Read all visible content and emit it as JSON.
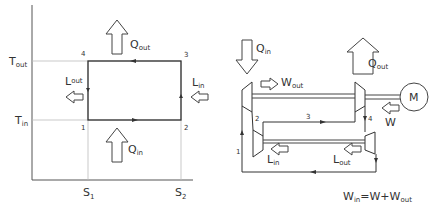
{
  "ts_diagram": {
    "axes": {
      "y_ticks": [
        {
          "main": "T",
          "sub": "out"
        },
        {
          "main": "T",
          "sub": "in"
        }
      ],
      "x_ticks": [
        {
          "main": "S",
          "sub": "1"
        },
        {
          "main": "S",
          "sub": "2"
        }
      ]
    },
    "points": [
      "1",
      "2",
      "3",
      "4"
    ],
    "arrows": {
      "q_out": {
        "main": "Q",
        "sub": "out"
      },
      "q_in": {
        "main": "Q",
        "sub": "in"
      },
      "l_out": {
        "main": "L",
        "sub": "out"
      },
      "l_in": {
        "main": "L",
        "sub": "in"
      }
    }
  },
  "machine_diagram": {
    "arrows": {
      "q_in": {
        "main": "Q",
        "sub": "in"
      },
      "q_out": {
        "main": "Q",
        "sub": "out"
      },
      "w_out": {
        "main": "W",
        "sub": "out"
      },
      "w": {
        "main": "W"
      },
      "l_in": {
        "main": "L",
        "sub": "in"
      },
      "l_out": {
        "main": "L",
        "sub": "out"
      }
    },
    "points": [
      "1",
      "2",
      "3",
      "4"
    ],
    "motor_label": "M",
    "equation": {
      "lhs_main": "W",
      "lhs_sub": "in",
      "eq": "=W+",
      "rhs_main": "W",
      "rhs_sub": "out"
    }
  },
  "colors": {
    "line": "#444444",
    "grid": "#bbbbbb",
    "text": "#333333"
  }
}
